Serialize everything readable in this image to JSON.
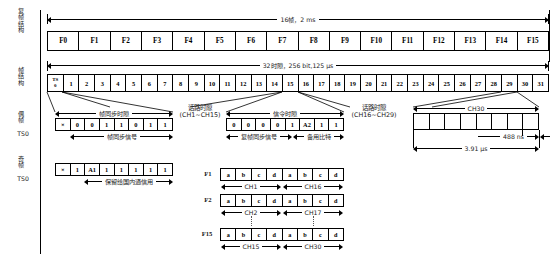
{
  "row_labels": {
    "multiframe": "复帧结构",
    "frame": "帧结构",
    "even_frame": "偶帧",
    "even_frame_ts": "TS0",
    "odd_frame": "奇帧",
    "odd_frame_ts": "TS0"
  },
  "multiframe": {
    "dimension": "16帧，2 ms",
    "frames": [
      "F0",
      "F1",
      "F2",
      "F3",
      "F4",
      "F5",
      "F6",
      "F7",
      "F8",
      "F9",
      "F10",
      "F11",
      "F12",
      "F13",
      "F14",
      "F15"
    ]
  },
  "frame": {
    "dimension": "32时隙，256 bit,125 μs",
    "ts0_top": "TS",
    "ts0_bottom": "0",
    "timeslots": [
      "1",
      "2",
      "3",
      "4",
      "5",
      "6",
      "7",
      "8",
      "9",
      "10",
      "11",
      "12",
      "13",
      "14",
      "15",
      "16",
      "17",
      "18",
      "19",
      "20",
      "21",
      "22",
      "23",
      "24",
      "25",
      "26",
      "27",
      "28",
      "29",
      "30",
      "31"
    ]
  },
  "even_ts0": {
    "caption": "帧同步时隙",
    "bits": [
      "×",
      "0",
      "0",
      "1",
      "1",
      "0",
      "1",
      "1"
    ],
    "sub_caption": "帧同步信号"
  },
  "odd_ts0": {
    "bits": [
      "×",
      "1",
      "A1",
      "1",
      "1",
      "1",
      "1",
      "1"
    ],
    "sub_caption": "保留给国内通信用"
  },
  "ts16": {
    "caption": "信令时隙",
    "bits": [
      "0",
      "0",
      "0",
      "0",
      "1",
      "A2",
      "1",
      "1"
    ],
    "sub_caption_left": "复帧同步信号",
    "sub_caption_right": "备用比特"
  },
  "speech_left": {
    "line1": "话路时隙",
    "line2": "(CH1~CH15)"
  },
  "speech_right": {
    "line1": "话路时隙",
    "line2": "(CH16~CH29)"
  },
  "ch30": {
    "caption": "CH30",
    "bit_duration": "488 ns",
    "slot_duration": "3.91 μs",
    "cells": [
      "",
      "",
      "",
      "",
      "",
      "",
      "",
      ""
    ]
  },
  "signalling_rows": [
    {
      "frame_label": "F1",
      "bits": [
        "a",
        "b",
        "c",
        "d",
        "a",
        "b",
        "c",
        "d"
      ],
      "left_channel": "CH1",
      "right_channel": "CH16"
    },
    {
      "frame_label": "F2",
      "bits": [
        "a",
        "b",
        "c",
        "d",
        "a",
        "b",
        "c",
        "d"
      ],
      "left_channel": "CH2",
      "right_channel": "CH17"
    },
    {
      "frame_label": "F15",
      "bits": [
        "a",
        "b",
        "c",
        "d",
        "a",
        "b",
        "c",
        "d"
      ],
      "left_channel": "CH15",
      "right_channel": "CH30"
    }
  ],
  "colors": {
    "line": "#000000",
    "text": "#1a1a1a",
    "background": "#ffffff"
  }
}
